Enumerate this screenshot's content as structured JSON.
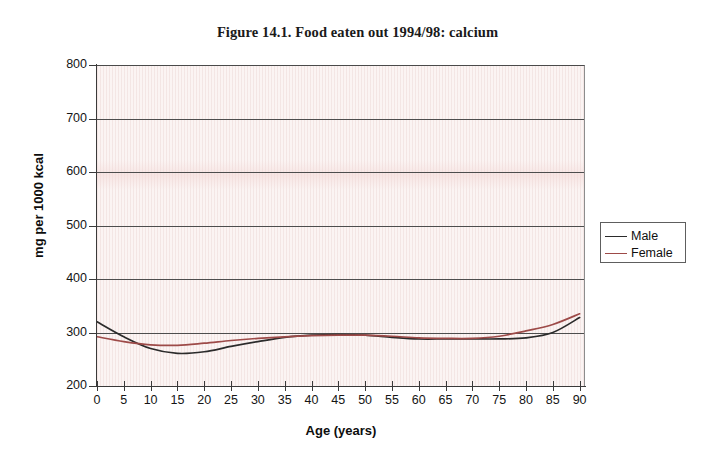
{
  "figure": {
    "title": "Figure 14.1. Food eaten out 1994/98: calcium"
  },
  "legend": {
    "position": "right",
    "items": [
      {
        "label": "Male",
        "color": "#2b2b2b"
      },
      {
        "label": "Female",
        "color": "#9d4a48"
      }
    ]
  },
  "colors": {
    "male_line": "#2b2b2b",
    "female_line": "#9d4a48",
    "gridline": "#4d4d4d",
    "axis": "#3a3a3a",
    "plot_background": "#fbf4f3"
  },
  "chart_data": {
    "type": "line",
    "title": "Figure 14.1. Food eaten out 1994/98: calcium",
    "xlabel": "Age (years)",
    "ylabel": "mg per 1000 kcal",
    "xlim": [
      0,
      91
    ],
    "ylim": [
      200,
      800
    ],
    "ytick_step": 100,
    "xtick_step": 5,
    "grid": "horizontal",
    "legend_position": "right",
    "ytick_labels": [
      "200",
      "300",
      "400",
      "500",
      "600",
      "700",
      "800"
    ],
    "xtick_labels": [
      "0",
      "5",
      "10",
      "15",
      "20",
      "25",
      "30",
      "35",
      "40",
      "45",
      "50",
      "55",
      "60",
      "65",
      "70",
      "75",
      "80",
      "85",
      "90"
    ],
    "x": [
      0,
      5,
      10,
      15,
      20,
      25,
      30,
      35,
      40,
      45,
      50,
      55,
      60,
      65,
      70,
      75,
      80,
      85,
      90
    ],
    "series": [
      {
        "name": "Male",
        "color": "#2b2b2b",
        "values": [
          320,
          292,
          270,
          261,
          264,
          274,
          283,
          291,
          295,
          296,
          295,
          291,
          288,
          288,
          288,
          288,
          290,
          300,
          328
        ]
      },
      {
        "name": "Female",
        "color": "#9d4a48",
        "values": [
          292,
          283,
          277,
          276,
          280,
          285,
          289,
          292,
          294,
          295,
          295,
          293,
          290,
          289,
          289,
          293,
          303,
          315,
          335
        ]
      }
    ]
  }
}
